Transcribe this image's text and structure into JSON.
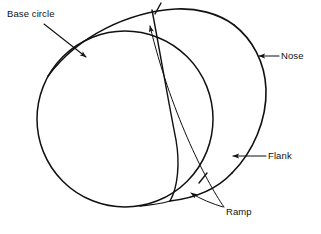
{
  "figure": {
    "kind": "cam-profile-diagram",
    "background_color": "#ffffff",
    "line_color": "#111111",
    "text_color": "#111111",
    "width": 321,
    "height": 234
  },
  "labels": {
    "base_circle": "Base circle",
    "nose": "Nose",
    "flank": "Flank",
    "ramp": "Ramp"
  },
  "geometry": {
    "base_circle": {
      "name": "base-circle",
      "center_x": 125,
      "center_y": 119,
      "radius": 88
    },
    "nose_arc": {
      "name": "nose-arc",
      "center_x": 178,
      "center_y": 92,
      "radius": 89
    },
    "ramp_arc": {
      "name": "ramp-arc",
      "note": "shallow arc across the top from base circle to nose"
    },
    "flank_arc": {
      "name": "flank-arc",
      "note": "long arc from top of cam sweeping down to the ramp junction at lower right"
    },
    "tick_marks": [
      {
        "name": "ramp-tick-top",
        "x": 158,
        "y": 9
      },
      {
        "name": "ramp-tick-lower",
        "x": 203,
        "y": 178
      }
    ],
    "junction_point": {
      "x": 170,
      "y": 201
    }
  },
  "leaders": {
    "base_circle": {
      "from_x": 44,
      "from_y": 24,
      "to_x": 88,
      "to_y": 58
    },
    "nose": {
      "from_x": 279,
      "from_y": 56,
      "to_x": 258,
      "to_y": 56
    },
    "flank": {
      "from_x": 266,
      "from_y": 156,
      "to_x": 232,
      "to_y": 156
    },
    "ramp_upper": {
      "from_x": 224,
      "from_y": 208,
      "to_x": 149,
      "to_y": 18
    },
    "ramp_lower": {
      "from_x": 224,
      "from_y": 208,
      "to_x": 189,
      "to_y": 192
    }
  }
}
